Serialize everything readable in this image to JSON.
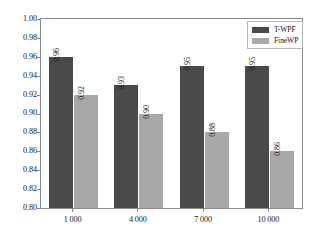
{
  "chart_data": {
    "type": "bar",
    "title": "",
    "subtitle": "",
    "xlabel": "",
    "ylabel": "",
    "categories": [
      "1 000",
      "4 000",
      "7 000",
      "10 000"
    ],
    "series": [
      {
        "name": "T-WPF",
        "color": "#4a4a4a",
        "values": [
          0.96,
          0.93,
          0.95,
          0.95
        ],
        "labels": [
          "0.96",
          "0.93",
          "0.95",
          "0.95"
        ]
      },
      {
        "name": "FineWP",
        "color": "#a8a8a8",
        "values": [
          0.92,
          0.9,
          0.88,
          0.86
        ],
        "labels": [
          "0.92",
          "0.90",
          "0.88",
          "0.86"
        ]
      }
    ],
    "ylim": [
      0.8,
      1.0
    ],
    "yticks": [
      1.0,
      0.98,
      0.96,
      0.94,
      0.92,
      0.9,
      0.88,
      0.86,
      0.84,
      0.82,
      0.8
    ],
    "ytick_labels": [
      "1.00",
      "0.98",
      "0.96",
      "0.94",
      "0.92",
      "0.90",
      "0.88",
      "0.86",
      "0.84",
      "0.82",
      "0.80"
    ],
    "grid": false,
    "legend_position": "top-right",
    "data_labels_rotated": true,
    "background_color": "#ffffff",
    "axis_color": "#8a8a8a"
  },
  "legend": {
    "entries": [
      {
        "label": "T-WPF",
        "color": "#4a4a4a"
      },
      {
        "label": "FineWP",
        "color": "#a8a8a8"
      }
    ]
  }
}
